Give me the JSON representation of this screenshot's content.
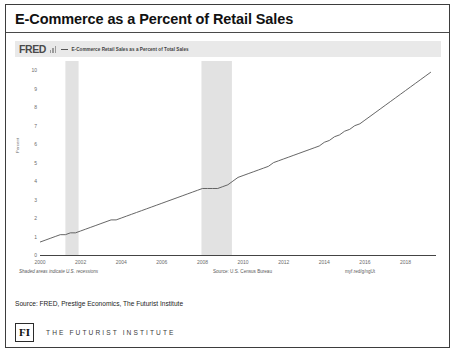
{
  "slide": {
    "title": "E-Commerce as a Percent of Retail Sales",
    "source_note": "Source: FRED, Prestige Economics, The Futurist Institute",
    "brand_mark": "FI",
    "brand_name": "THE FUTURIST INSTITUTE"
  },
  "fred": {
    "logo": "FRED",
    "legend_label": "E-Commerce Retail Sales as a Percent of Total Sales",
    "note_recessions": "Shaded areas indicate U.S. recessions",
    "note_source": "Source: U.S. Census Bureau",
    "short_url": "myf.red/g/ngUt"
  },
  "chart_data": {
    "type": "line",
    "title": "E-Commerce Retail Sales as a Percent of Total Sales",
    "xlabel": "",
    "ylabel": "Percent",
    "ylim": [
      0,
      10.5
    ],
    "xlim": [
      2000,
      2019.5
    ],
    "yticks": [
      0,
      1,
      2,
      3,
      4,
      5,
      6,
      7,
      8,
      9,
      10
    ],
    "xticks": [
      2000,
      2002,
      2004,
      2006,
      2008,
      2010,
      2012,
      2014,
      2016,
      2018
    ],
    "grid": false,
    "legend_position": "top-left",
    "line_color": "#555555",
    "recession_color": "#e2e2e2",
    "recessions": [
      {
        "start": 2001.25,
        "end": 2001.9
      },
      {
        "start": 2007.95,
        "end": 2009.45
      }
    ],
    "x": [
      2000.0,
      2000.25,
      2000.5,
      2000.75,
      2001.0,
      2001.25,
      2001.5,
      2001.75,
      2002.0,
      2002.25,
      2002.5,
      2002.75,
      2003.0,
      2003.25,
      2003.5,
      2003.75,
      2004.0,
      2004.25,
      2004.5,
      2004.75,
      2005.0,
      2005.25,
      2005.5,
      2005.75,
      2006.0,
      2006.25,
      2006.5,
      2006.75,
      2007.0,
      2007.25,
      2007.5,
      2007.75,
      2008.0,
      2008.25,
      2008.5,
      2008.75,
      2009.0,
      2009.25,
      2009.5,
      2009.75,
      2010.0,
      2010.25,
      2010.5,
      2010.75,
      2011.0,
      2011.25,
      2011.5,
      2011.75,
      2012.0,
      2012.25,
      2012.5,
      2012.75,
      2013.0,
      2013.25,
      2013.5,
      2013.75,
      2014.0,
      2014.25,
      2014.5,
      2014.75,
      2015.0,
      2015.25,
      2015.5,
      2015.75,
      2016.0,
      2016.25,
      2016.5,
      2016.75,
      2017.0,
      2017.25,
      2017.5,
      2017.75,
      2018.0,
      2018.25,
      2018.5,
      2018.75,
      2019.0,
      2019.25
    ],
    "values": [
      0.7,
      0.8,
      0.9,
      1.0,
      1.1,
      1.1,
      1.2,
      1.2,
      1.3,
      1.4,
      1.5,
      1.6,
      1.7,
      1.8,
      1.9,
      1.9,
      2.0,
      2.1,
      2.2,
      2.3,
      2.4,
      2.5,
      2.6,
      2.7,
      2.8,
      2.9,
      3.0,
      3.1,
      3.2,
      3.3,
      3.4,
      3.5,
      3.6,
      3.6,
      3.6,
      3.6,
      3.7,
      3.8,
      4.0,
      4.2,
      4.3,
      4.4,
      4.5,
      4.6,
      4.7,
      4.8,
      5.0,
      5.1,
      5.2,
      5.3,
      5.4,
      5.5,
      5.6,
      5.7,
      5.8,
      5.9,
      6.1,
      6.2,
      6.4,
      6.5,
      6.7,
      6.8,
      7.0,
      7.1,
      7.3,
      7.5,
      7.7,
      7.9,
      8.1,
      8.3,
      8.5,
      8.7,
      8.9,
      9.1,
      9.3,
      9.5,
      9.7,
      9.9
    ]
  }
}
